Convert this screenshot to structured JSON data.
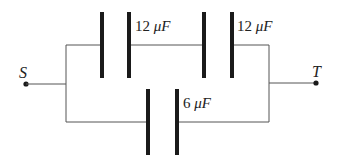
{
  "diagram": {
    "type": "capacitor-circuit",
    "nodes": {
      "left": {
        "label": "S"
      },
      "right": {
        "label": "T"
      }
    },
    "capacitors": [
      {
        "id": "C1",
        "value": "12",
        "unit": "μF",
        "branch": "top",
        "position": "first"
      },
      {
        "id": "C2",
        "value": "12",
        "unit": "μF",
        "branch": "top",
        "position": "second"
      },
      {
        "id": "C3",
        "value": "6",
        "unit": "μF",
        "branch": "bottom",
        "position": "only"
      }
    ],
    "topology": "Two 12 μF capacitors in series (top branch) in parallel with a 6 μF capacitor (bottom branch) between terminals S and T",
    "colors": {
      "wire": "#555555",
      "plate": "#1a1a1a",
      "text": "#222222"
    }
  }
}
